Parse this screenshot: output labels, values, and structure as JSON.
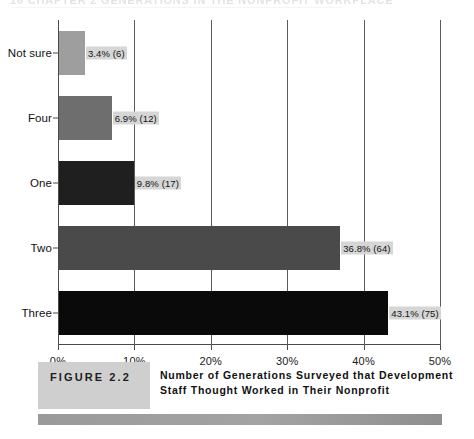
{
  "page_header": {
    "text": "16    CHAPTER 2  GENERATIONS IN THE NONPROFIT WORKPLACE"
  },
  "chart_data": {
    "type": "bar",
    "orientation": "horizontal",
    "title": "",
    "xlabel": "",
    "ylabel": "",
    "categories": [
      "Not sure",
      "Four",
      "One",
      "Two",
      "Three"
    ],
    "values": [
      3.4,
      6.9,
      9.8,
      36.8,
      43.1
    ],
    "counts": [
      6,
      12,
      17,
      64,
      75
    ],
    "data_labels": [
      "3.4% (6)",
      "6.9% (12)",
      "9.8% (17)",
      "36.8% (64)",
      "43.1% (75)"
    ],
    "bar_colors": [
      "#9e9e9e",
      "#6e6e6e",
      "#1f1f1f",
      "#4a4a4a",
      "#0a0a0a"
    ],
    "xlim": [
      0,
      50
    ],
    "xticks": [
      0,
      10,
      20,
      30,
      40,
      50
    ],
    "xtick_labels": [
      "0%",
      "10%",
      "20%",
      "30%",
      "40%",
      "50%"
    ],
    "grid": true,
    "grid_axis": "x",
    "legend": "none"
  },
  "caption": {
    "figure_label": "FIGURE 2.2",
    "title": "Number of Generations Surveyed that Development Staff Thought Worked in Their Nonprofit"
  },
  "colors": {
    "axis": "#4a4a4a",
    "grid": "#5a5a5a",
    "label_background": "#d6d6d6",
    "badge_background": "#cfcfcf",
    "rule": "#9a9a9a"
  }
}
